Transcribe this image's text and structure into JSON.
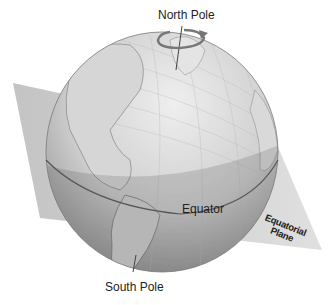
{
  "diagram": {
    "labels": {
      "north_pole": "North Pole",
      "south_pole": "South Pole",
      "equator": "Equator",
      "equatorial_plane_line1": "Equatorial",
      "equatorial_plane_line2": "Plane"
    },
    "icons": {
      "rotation_arrow": "rotation-arrow-icon"
    },
    "colors": {
      "plane": "#c9c9c9",
      "globe_light": "#e6e6e6",
      "globe_dark": "#8f8f8f",
      "equator_line": "#555555",
      "land": "#d8d8d8",
      "text": "#222222"
    }
  }
}
